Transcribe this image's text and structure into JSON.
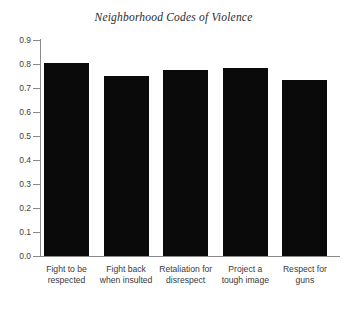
{
  "chart_data": {
    "type": "bar",
    "title": "Neighborhood Codes of Violence",
    "xlabel": "",
    "ylabel": "",
    "ylim": [
      0.0,
      0.9
    ],
    "grid": false,
    "legend": null,
    "bar_color": "#0a0a0a",
    "axis_color": "#8a8a8a",
    "y_ticks": [
      "0.0",
      "0.1",
      "0.2",
      "0.3",
      "0.4",
      "0.5",
      "0.6",
      "0.7",
      "0.8",
      "0.9"
    ],
    "y_tick_values": [
      0.0,
      0.1,
      0.2,
      0.3,
      0.4,
      0.5,
      0.6,
      0.7,
      0.8,
      0.9
    ],
    "categories": [
      "Fight to be respected",
      "Fight back when insulted",
      "Retaliation for disrespect",
      "Project a tough image",
      "Respect for guns"
    ],
    "category_lines": [
      [
        "Fight to be",
        "respected"
      ],
      [
        "Fight back",
        "when insulted"
      ],
      [
        "Retaliation for",
        "disrespect"
      ],
      [
        "Project a",
        "tough image"
      ],
      [
        "Respect for",
        "guns"
      ]
    ],
    "values": [
      0.805,
      0.75,
      0.775,
      0.785,
      0.735
    ]
  }
}
